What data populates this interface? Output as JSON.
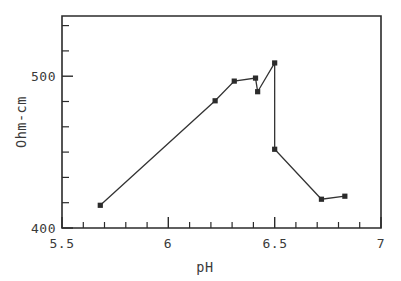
{
  "chart_data": {
    "type": "line",
    "title": "",
    "xlabel": "pH",
    "ylabel": "Ohm-cm",
    "xlim": [
      5.5,
      7.0
    ],
    "ylim": [
      400,
      540
    ],
    "grid": false,
    "legend": null,
    "xticks_major": [
      "5.5",
      "6",
      "6.5",
      "7"
    ],
    "xtick_major_values": [
      5.5,
      6.0,
      6.5,
      7.0
    ],
    "xtick_minor_values": [
      5.6,
      5.7,
      5.8,
      5.9,
      6.1,
      6.2,
      6.3,
      6.4,
      6.6,
      6.7,
      6.8,
      6.9
    ],
    "yticks_major": [
      "400",
      "500"
    ],
    "ytick_major_values": [
      400,
      500
    ],
    "ytick_minor_values": [
      410,
      420,
      430,
      440,
      450,
      460,
      470,
      480,
      490,
      510,
      520,
      530
    ],
    "ytick_labeled_values": [
      400,
      500
    ],
    "series": [
      {
        "name": "resistivity",
        "marker": "square",
        "x": [
          5.68,
          6.22,
          6.31,
          6.41,
          6.42,
          6.5,
          6.5,
          6.72,
          6.83
        ],
        "y": [
          415,
          484,
          497,
          499,
          490,
          509,
          452,
          419,
          421
        ]
      }
    ],
    "points": [
      {
        "ph": 5.68,
        "ohm_cm": 415
      },
      {
        "ph": 6.22,
        "ohm_cm": 484
      },
      {
        "ph": 6.31,
        "ohm_cm": 497
      },
      {
        "ph": 6.41,
        "ohm_cm": 499
      },
      {
        "ph": 6.42,
        "ohm_cm": 490
      },
      {
        "ph": 6.5,
        "ohm_cm": 509
      },
      {
        "ph": 6.5,
        "ohm_cm": 452
      },
      {
        "ph": 6.72,
        "ohm_cm": 419
      },
      {
        "ph": 6.83,
        "ohm_cm": 421
      }
    ],
    "colors": {
      "line": "#333333",
      "marker": "#2b2b2b",
      "axis": "#2b2b2b",
      "text": "#3a3a3a",
      "background": "#ffffff"
    }
  },
  "labels": {
    "x_5_5": "5.5",
    "x_6": "6",
    "x_6_5": "6.5",
    "x_7": "7",
    "y_400": "400",
    "y_500": "500",
    "x_axis_title": "pH",
    "y_axis_title": "Ohm-cm"
  }
}
